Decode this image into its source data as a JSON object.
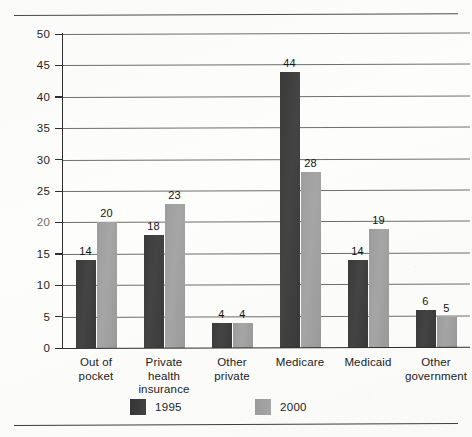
{
  "chart_data": {
    "type": "bar",
    "title": "",
    "xlabel": "",
    "ylabel": "Percent",
    "ylim": [
      0,
      50
    ],
    "ytick_values": [
      0,
      5,
      10,
      15,
      20,
      25,
      30,
      35,
      40,
      45,
      50
    ],
    "ytick_labels": [
      "0",
      "5",
      "10",
      "15",
      "20",
      "25",
      "30",
      "35",
      "40",
      "45",
      "50"
    ],
    "grid": true,
    "legend_position": "bottom",
    "categories": [
      "Out of\npocket",
      "Private\nhealth\ninsurance",
      "Other\nprivate",
      "Medicare",
      "Medicaid",
      "Other\ngovernment"
    ],
    "series": [
      {
        "name": "1995",
        "color": "#3a3a3a",
        "values": [
          14,
          18,
          4,
          44,
          14,
          6
        ],
        "labels": [
          "14",
          "18",
          "4",
          "44",
          "14",
          "6"
        ]
      },
      {
        "name": "2000",
        "color": "#9d9d9d",
        "values": [
          20,
          23,
          4,
          28,
          19,
          5
        ],
        "labels": [
          "20",
          "23",
          "4",
          "28",
          "19",
          "5"
        ]
      }
    ]
  },
  "legend": {
    "items": [
      {
        "label": "1995",
        "swatch": "dark-swatch"
      },
      {
        "label": "2000",
        "swatch": "light-swatch"
      }
    ]
  }
}
